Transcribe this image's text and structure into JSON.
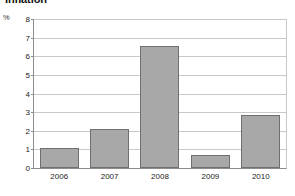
{
  "chart_data": {
    "type": "bar",
    "title": "Inflation",
    "xlabel": "",
    "ylabel": "%",
    "categories": [
      "2006",
      "2007",
      "2008",
      "2009",
      "2010"
    ],
    "values": [
      1.05,
      2.1,
      6.55,
      0.68,
      2.85
    ],
    "ylim": [
      0,
      8
    ],
    "ytick_labels": [
      "0",
      "1",
      "2",
      "3",
      "4",
      "5",
      "6",
      "7",
      "8"
    ],
    "ytick_values": [
      0,
      1,
      2,
      3,
      4,
      5,
      6,
      7,
      8
    ],
    "grid": "horizontal",
    "legend": "none",
    "bar_color": "#a8a8a8",
    "bar_edge_color": "#707070",
    "gridline_color": "#c9c9c9",
    "axis_color": "#8c8c8c"
  }
}
